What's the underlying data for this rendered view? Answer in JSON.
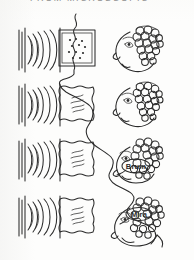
{
  "page": {
    "title": "FROM MICROSCOPIC",
    "background_color": "#fdfdfc",
    "ink_color": "#2b2b2b",
    "width": 194,
    "height": 260,
    "media": "black-and-white scanned line drawing"
  },
  "diagram": {
    "type": "process-sequence",
    "column_headers": [
      "sound-source",
      "signal-panel",
      "listener-head"
    ],
    "connector": {
      "name": "wavy-connector-line",
      "style": "hand-drawn squiggle",
      "path_description": "descends from row 1 panel down through row 4 head"
    },
    "rows": [
      {
        "index": 1,
        "sound_waves": {
          "name": "sound-wave-glyph",
          "bars": 3,
          "arcs": 5,
          "orientation": "emitting-right"
        },
        "panel": {
          "name": "signal-panel",
          "border": "double-square",
          "content": "dot-matrix",
          "dots": 11,
          "label": ""
        },
        "head": {
          "name": "listener-head",
          "facing": "left",
          "hair": "curly",
          "balloon": null,
          "balloon_text": ""
        }
      },
      {
        "index": 2,
        "sound_waves": {
          "name": "sound-wave-glyph",
          "bars": 3,
          "arcs": 5,
          "orientation": "emitting-right"
        },
        "panel": {
          "name": "signal-panel",
          "border": "wavy-square",
          "content": "squiggle-lines",
          "dots": 0,
          "label": ""
        },
        "head": {
          "name": "listener-head",
          "facing": "left",
          "hair": "curly",
          "balloon": null,
          "balloon_text": ""
        }
      },
      {
        "index": 3,
        "sound_waves": {
          "name": "sound-wave-glyph",
          "bars": 3,
          "arcs": 5,
          "orientation": "emitting-right"
        },
        "panel": {
          "name": "signal-panel",
          "border": "wavy-square",
          "content": "squiggle-lines",
          "dots": 0,
          "label": ""
        },
        "head": {
          "name": "listener-head",
          "facing": "left",
          "hair": "curly",
          "balloon": "speech-balloon",
          "balloon_text": "Brum"
        }
      },
      {
        "index": 4,
        "sound_waves": {
          "name": "sound-wave-glyph",
          "bars": 3,
          "arcs": 5,
          "orientation": "emitting-right"
        },
        "panel": {
          "name": "signal-panel",
          "border": "wavy-square",
          "content": "squiggle-lines",
          "dots": 0,
          "label": ""
        },
        "head": {
          "name": "listener-head",
          "facing": "left",
          "hair": "curly",
          "balloon": "speech-balloon",
          "balloon_text": "Mira"
        }
      }
    ]
  }
}
